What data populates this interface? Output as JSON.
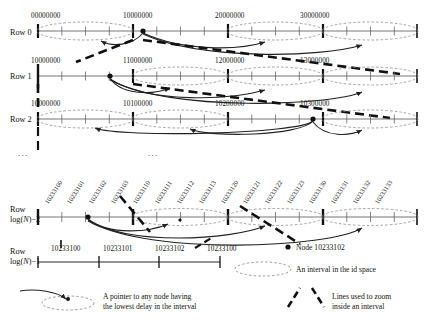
{
  "figure": {
    "colors": {
      "ink": "#111111",
      "axis": "#555555",
      "dashed_ellipse": "#777777",
      "pointer": "#222222",
      "zoom_line": "#000000"
    }
  },
  "rows": [
    {
      "id": "row-0",
      "label": "Row 0",
      "label_line2": "",
      "ticks": [
        "00000000",
        "10000000",
        "20000000",
        "30000000"
      ]
    },
    {
      "id": "row-1",
      "label": "Row 1",
      "label_line2": "",
      "ticks": [
        "10000000",
        "11000000",
        "12000000",
        "13000000"
      ]
    },
    {
      "id": "row-2",
      "label": "Row 2",
      "label_line2": "",
      "ticks": [
        "10000000",
        "10100000",
        "10200000",
        "10300000"
      ]
    },
    {
      "id": "row-logn-2",
      "label": "Row",
      "label_line2": "log(N)−2",
      "ticks": [
        "10233100",
        "10233101",
        "10233102",
        "10233103",
        "10233110",
        "10233111",
        "10233112",
        "10233113",
        "10233120",
        "10233121",
        "10233122",
        "10233123",
        "10233130",
        "10233131",
        "10233132",
        "10233133"
      ]
    },
    {
      "id": "row-logn-1",
      "label": "Row",
      "label_line2": "log(N)−1",
      "ticks": [
        "10233100",
        "10233101",
        "10233102",
        "10233100"
      ]
    }
  ],
  "ellipses": {
    "separator_dots": [
      "...",
      "..."
    ]
  },
  "legend": {
    "node": {
      "marker": "node-dot-icon",
      "text": "Node 10233102"
    },
    "interval": {
      "marker": "dashed-ellipse-icon",
      "text": "An interval in the id space"
    },
    "pointer": {
      "marker": "pointer-arrow-icon",
      "line1": "A pointer to any node having",
      "line2": "the lowest delay in the interval"
    },
    "zoom": {
      "marker": "zoom-dashed-lines-icon",
      "line1": "Lines used to zoom",
      "line2": "inside an interval"
    }
  }
}
